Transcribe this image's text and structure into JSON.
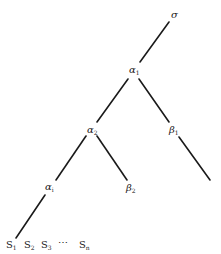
{
  "diagram": {
    "type": "tree",
    "nodes": [
      {
        "id": "sigma",
        "symbol": "σ",
        "sub": ""
      },
      {
        "id": "alpha1",
        "symbol": "α",
        "sub": "1"
      },
      {
        "id": "alpha2",
        "symbol": "α",
        "sub": "2"
      },
      {
        "id": "beta1",
        "symbol": "β",
        "sub": "1"
      },
      {
        "id": "alphai",
        "symbol": "α",
        "sub": "i"
      },
      {
        "id": "beta2",
        "symbol": "β",
        "sub": "2"
      }
    ],
    "leaves": [
      {
        "symbol": "S",
        "sub": "1"
      },
      {
        "symbol": "S",
        "sub": "2"
      },
      {
        "symbol": "S",
        "sub": "3"
      },
      {
        "symbol": "⋯",
        "sub": ""
      },
      {
        "symbol": "S",
        "sub": "n"
      }
    ],
    "edges": [
      [
        "sigma",
        "alpha1"
      ],
      [
        "alpha1",
        "alpha2"
      ],
      [
        "alpha1",
        "beta1"
      ],
      [
        "alpha2",
        "alphai"
      ],
      [
        "alpha2",
        "beta2"
      ],
      [
        "beta1",
        "unlabeled-end"
      ],
      [
        "alphai",
        "S1"
      ]
    ]
  }
}
